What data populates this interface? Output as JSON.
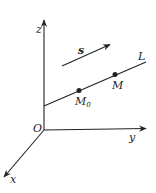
{
  "diagram": {
    "type": "3d-coordinate-line",
    "axes": {
      "origin_label": "O",
      "x_label": "x",
      "y_label": "y",
      "z_label": "z"
    },
    "line": {
      "label": "L"
    },
    "points": [
      {
        "label": "M",
        "sub": "0"
      },
      {
        "label": "M",
        "sub": ""
      }
    ],
    "vector": {
      "label": "s"
    },
    "colors": {
      "stroke": "#222222",
      "background": "#ffffff"
    }
  }
}
